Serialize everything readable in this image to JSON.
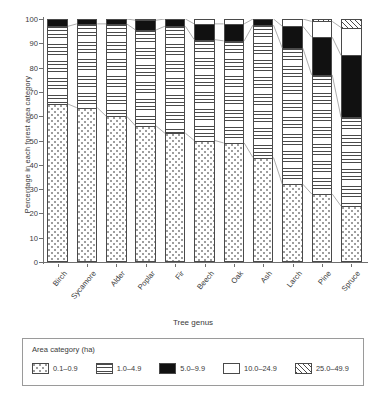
{
  "chart_data": {
    "type": "bar",
    "stacked": true,
    "title": "",
    "xlabel": "Tree genus",
    "ylabel": "Percentage in each forest area category",
    "ylim": [
      0,
      100
    ],
    "yticks": [
      0,
      10,
      20,
      30,
      40,
      50,
      60,
      70,
      80,
      90,
      100
    ],
    "grid": false,
    "legend_title": "Area category (ha)",
    "legend_position": "bottom",
    "categories": [
      "Birch",
      "Sycamore",
      "Alder",
      "Poplar",
      "Fir",
      "Beech",
      "Oak",
      "Ash",
      "Larch",
      "Pine",
      "Spruce"
    ],
    "series": [
      {
        "name": "0.1-0.9",
        "pattern": "dots",
        "values": [
          65.0,
          63.5,
          60.0,
          56.0,
          53.0,
          50.0,
          49.0,
          43.0,
          32.0,
          28.0,
          23.0
        ]
      },
      {
        "name": "1.0-4.9",
        "pattern": "hlines",
        "values": [
          32.0,
          34.5,
          38.0,
          39.5,
          44.0,
          41.5,
          42.0,
          54.5,
          56.0,
          49.0,
          36.5
        ]
      },
      {
        "name": "5.0-9.9",
        "pattern": "black",
        "values": [
          3.0,
          2.0,
          2.0,
          4.0,
          3.0,
          6.5,
          7.0,
          2.5,
          9.0,
          15.5,
          25.5
        ]
      },
      {
        "name": "10.0-24.9",
        "pattern": "white",
        "values": [
          0.0,
          0.0,
          0.0,
          0.5,
          0.0,
          2.0,
          2.0,
          0.0,
          3.0,
          6.5,
          11.5
        ]
      },
      {
        "name": "25.0-49.9",
        "pattern": "hatch",
        "values": [
          0.0,
          0.0,
          0.0,
          0.0,
          0.0,
          0.0,
          0.0,
          0.0,
          0.0,
          1.0,
          3.5
        ]
      }
    ]
  },
  "axis": {
    "ylabel": "Percentage in each forest area category",
    "xlabel": "Tree genus",
    "ytick_labels": [
      "0",
      "10",
      "20",
      "30",
      "40",
      "50",
      "60",
      "70",
      "80",
      "90",
      "100"
    ]
  },
  "legend": {
    "title": "Area category (ha)",
    "items": [
      {
        "label": "0.1–0.9",
        "pattern": "dots"
      },
      {
        "label": "1.0–4.9",
        "pattern": "hlines"
      },
      {
        "label": "5.0–9.9",
        "pattern": "black"
      },
      {
        "label": "10.0–24.9",
        "pattern": "white"
      },
      {
        "label": "25.0–49.9",
        "pattern": "hatch"
      }
    ]
  },
  "colors": {
    "ink": "#2b2b2b",
    "axis": "#6f6f6f",
    "fill_black": "#111111",
    "fill_white": "#ffffff",
    "pattern_gray": "#4a4a4a"
  }
}
